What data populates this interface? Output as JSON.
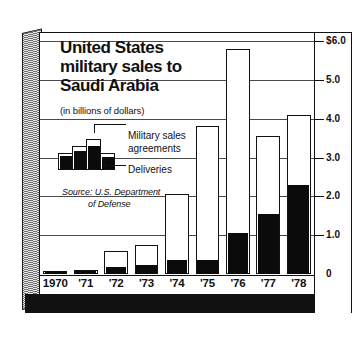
{
  "chart_data": {
    "type": "bar",
    "title": "United States military sales to Saudi Arabia",
    "title_lines": [
      "United States",
      "military sales to",
      "Saudi Arabia"
    ],
    "subtitle": "(in billions of dollars)",
    "xlabel": "",
    "ylabel": "",
    "ylim": [
      0,
      6.0
    ],
    "grid": true,
    "legend_position": "inside-upper-left",
    "categories": [
      "1970",
      "'71",
      "'72",
      "'73",
      "'74",
      "'75",
      "'76",
      "'77",
      "'78"
    ],
    "series": [
      {
        "name": "Military sales agreements",
        "values": [
          0.07,
          0.1,
          0.6,
          0.75,
          2.05,
          3.8,
          5.8,
          3.55,
          4.1
        ]
      },
      {
        "name": "Deliveries",
        "values": [
          0.04,
          0.08,
          0.17,
          0.22,
          0.35,
          0.37,
          1.05,
          1.55,
          2.3
        ]
      }
    ],
    "ticks": [
      {
        "label": "$6.0",
        "value": 6.0
      },
      {
        "label": "5.0",
        "value": 5.0
      },
      {
        "label": "4.0",
        "value": 4.0
      },
      {
        "label": "3.0",
        "value": 3.0
      },
      {
        "label": "2.0",
        "value": 2.0
      },
      {
        "label": "1.0",
        "value": 1.0
      },
      {
        "label": "0",
        "value": 0.0
      }
    ],
    "annotations": {
      "source_line1": "Source: U.S. Department",
      "source_line2": "of Defense"
    },
    "colors": {
      "agreements_fill": "#ffffff",
      "agreements_stroke": "#111111",
      "deliveries_fill": "#0b0b0b",
      "background": "#ffffff",
      "gridline": "#4a4a4a",
      "slab": "#bdbdbd"
    }
  },
  "legend": {
    "item_agreements": "Military sales",
    "item_agreements_line2": "agreements",
    "item_deliveries": "Deliveries"
  }
}
